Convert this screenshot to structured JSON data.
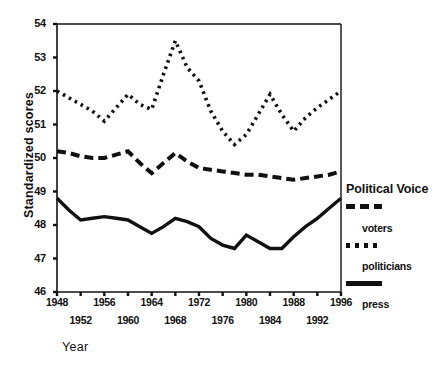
{
  "chart_data": {
    "type": "line",
    "title": "",
    "xlabel": "Year",
    "ylabel": "Standardized scores",
    "ylim": [
      46,
      54
    ],
    "xlim": [
      1948,
      1996
    ],
    "grid": false,
    "legend_position": "right",
    "legend_title": "Political Voice",
    "yticks": [
      46,
      47,
      48,
      49,
      50,
      51,
      52,
      53,
      54
    ],
    "xticks": [
      1948,
      1952,
      1956,
      1960,
      1964,
      1968,
      1972,
      1976,
      1980,
      1984,
      1988,
      1992,
      1996
    ],
    "xticklabels_top_row": [
      1948,
      1956,
      1964,
      1972,
      1980,
      1988,
      1996
    ],
    "xticklabels_bottom_row": [
      1952,
      1960,
      1968,
      1976,
      1984,
      1992
    ],
    "x": [
      1948,
      1950,
      1952,
      1954,
      1956,
      1958,
      1960,
      1962,
      1964,
      1966,
      1968,
      1970,
      1972,
      1974,
      1976,
      1978,
      1980,
      1982,
      1984,
      1986,
      1988,
      1990,
      1992,
      1994,
      1996
    ],
    "series": [
      {
        "name": "voters",
        "style": "dotted",
        "color": "#111111",
        "values": [
          52.0,
          51.8,
          51.6,
          51.4,
          51.1,
          51.5,
          51.9,
          51.6,
          51.45,
          52.5,
          53.5,
          52.7,
          52.3,
          51.4,
          50.8,
          50.4,
          50.7,
          51.3,
          51.9,
          51.3,
          50.8,
          51.2,
          51.5,
          51.75,
          52.0
        ]
      },
      {
        "name": "politicians",
        "style": "dashed",
        "color": "#111111",
        "values": [
          50.2,
          50.15,
          50.05,
          50.0,
          50.0,
          50.1,
          50.2,
          49.85,
          49.55,
          49.85,
          50.15,
          49.9,
          49.7,
          49.65,
          49.6,
          49.55,
          49.5,
          49.5,
          49.45,
          49.4,
          49.35,
          49.4,
          49.45,
          49.5,
          49.6
        ]
      },
      {
        "name": "press",
        "style": "solid",
        "color": "#111111",
        "values": [
          48.8,
          48.45,
          48.15,
          48.2,
          48.25,
          48.2,
          48.15,
          47.95,
          47.75,
          47.95,
          48.2,
          48.1,
          47.95,
          47.6,
          47.4,
          47.3,
          47.7,
          47.5,
          47.3,
          47.3,
          47.65,
          47.95,
          48.2,
          48.5,
          48.8
        ]
      }
    ]
  },
  "legend": {
    "title": "Political Voice",
    "entries": [
      {
        "swatch": "dashed",
        "label": "voters"
      },
      {
        "swatch": "dotted",
        "label": "politicians"
      },
      {
        "swatch": "solid",
        "label": "press"
      }
    ]
  },
  "axes": {
    "y_title": "Standardized scores",
    "x_title": "Year"
  }
}
